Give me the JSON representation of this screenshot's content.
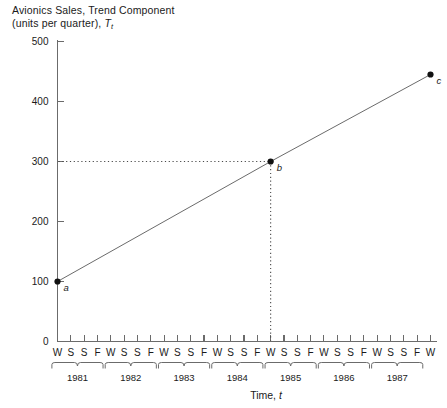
{
  "chart_data": {
    "type": "line",
    "title_line1": "Avionics Sales, Trend Component",
    "title_line2_prefix": "(units per quarter), ",
    "title_line2_symbol": "T",
    "title_line2_subscript": "t",
    "xlabel_prefix": "Time, ",
    "xlabel_symbol": "t",
    "ylabel": "",
    "ylim": [
      0,
      500
    ],
    "yticks": [
      0,
      100,
      200,
      300,
      400,
      500
    ],
    "ytick_labels": [
      "0",
      "100",
      "200",
      "300",
      "400",
      "500"
    ],
    "grid": false,
    "legend": false,
    "quarter_labels": [
      "W",
      "S",
      "S",
      "F",
      "W",
      "S",
      "S",
      "F",
      "W",
      "S",
      "S",
      "F",
      "W",
      "S",
      "S",
      "F",
      "W",
      "S",
      "S",
      "F",
      "W",
      "S",
      "S",
      "F",
      "W",
      "S",
      "S",
      "F",
      "W"
    ],
    "years": [
      "1981",
      "1982",
      "1983",
      "1984",
      "1985",
      "1986",
      "1987"
    ],
    "series": [
      {
        "name": "Trend component",
        "x_index": [
          0,
          16,
          28
        ],
        "values": [
          100,
          300,
          445
        ]
      }
    ],
    "points": [
      {
        "label": "a",
        "x_index": 0,
        "value": 100
      },
      {
        "label": "b",
        "x_index": 16,
        "value": 300
      },
      {
        "label": "c",
        "x_index": 28,
        "value": 445
      }
    ],
    "annotations": [
      {
        "type": "horizontal-guide",
        "from_axis": true,
        "value": 300,
        "to_point": "b",
        "style": "dotted"
      },
      {
        "type": "vertical-guide",
        "x_index": 16,
        "from_point": "b",
        "to_value": 0,
        "style": "dotted"
      }
    ]
  },
  "colors": {
    "background": "#ffffff",
    "axis": "#6b6b6b",
    "line": "#6b6b6b",
    "point": "#111111",
    "guide": "#4a4a4a",
    "text": "#1a1a1a"
  }
}
